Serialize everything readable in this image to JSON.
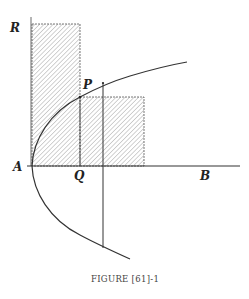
{
  "figure": {
    "caption": "Figure [61]-1",
    "caption_display": "FIGURE [61]-1",
    "labels": {
      "R": "R",
      "P": "P",
      "A": "A",
      "Q": "Q",
      "B": "B"
    },
    "colors": {
      "line": "#333333",
      "hatch": "#9a9a9a",
      "background": "#ffffff"
    },
    "elements": [
      {
        "name": "horizontal-axis",
        "from": "A",
        "to": "B"
      },
      {
        "name": "vertical-axis",
        "from": "A",
        "to": "R"
      },
      {
        "name": "parabola",
        "vertex": "A",
        "through": "P"
      },
      {
        "name": "rectangle-AQ-R",
        "shaded": true
      },
      {
        "name": "rectangle-QP",
        "shaded": true
      },
      {
        "name": "ordinate-through-P",
        "from": "P",
        "to": "Q",
        "dashed": true
      },
      {
        "name": "vertical-chord",
        "solid": true
      }
    ]
  }
}
